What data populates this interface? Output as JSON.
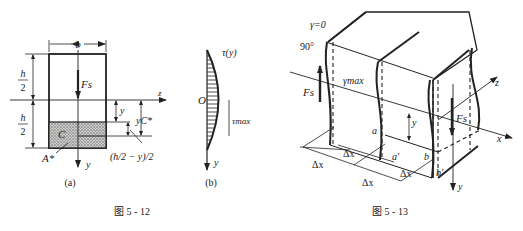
{
  "figures": [
    {
      "id": "fig-5-12",
      "caption": "图 5 - 12",
      "subfigures": [
        {
          "label": "(a)",
          "annotations": {
            "width": "b",
            "half_height_top_num": "h",
            "half_height_top_den": "2",
            "half_height_bottom_num": "h",
            "half_height_bottom_den": "2",
            "shear_force": "Fs",
            "z_axis": "z",
            "y_axis": "y",
            "y_dim": "y",
            "yc_dim": "yC*",
            "centroid": "C",
            "area": "A*",
            "formula": "(h/2 − y)/2"
          }
        },
        {
          "label": "(b)",
          "annotations": {
            "origin": "O",
            "tau_y": "τ(y)",
            "tau_max": "τmax",
            "y_axis": "y"
          }
        }
      ]
    },
    {
      "id": "fig-5-13",
      "caption": "图 5 - 13",
      "annotations": {
        "gamma_zero": "γ=0",
        "right_angle": "90°",
        "gamma_max": "γmax",
        "shear_force_left": "Fs",
        "shear_force_right": "Fs",
        "z_axis": "z",
        "x_axis": "x",
        "y_axis": "y",
        "y_dim": "y",
        "point_a": "a",
        "point_a_prime": "a′",
        "point_b": "b",
        "point_b_prime": "b′",
        "dx_labels": [
          "Δx",
          "Δx",
          "Δx",
          "Δx"
        ]
      }
    }
  ]
}
